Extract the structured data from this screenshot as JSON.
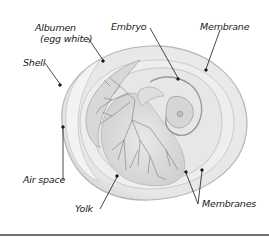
{
  "diagram": {
    "labels": {
      "albumen_line1": "Albumen",
      "albumen_line2": "(egg white)",
      "embryo": "Embryo",
      "membrane": "Membrane",
      "shell": "Shell",
      "air_space": "Air space",
      "yolk": "Yolk",
      "membranes": "Membranes"
    },
    "colors": {
      "shell_fill": "#e9e9e9",
      "albumen_fill": "#efefef",
      "yolk_fill": "#dcdcdc",
      "vessel_stroke": "#7a7a7a",
      "outline": "#b5b5b5",
      "leader": "#1a1a1a",
      "rule": "#6f6f6f"
    }
  }
}
